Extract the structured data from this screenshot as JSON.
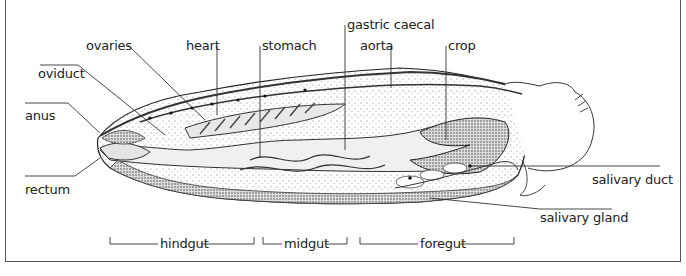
{
  "diagram": {
    "labels": {
      "ovaries": "ovaries",
      "oviduct": "oviduct",
      "anus": "anus",
      "rectum": "rectum",
      "heart": "heart",
      "stomach": "stomach",
      "gastric_caecal": "gastric caecal",
      "aorta": "aorta",
      "crop": "crop",
      "salivary_duct": "salivary duct",
      "salivary_gland": "salivary gland"
    },
    "regions": [
      {
        "label": "hindgut"
      },
      {
        "label": "midgut"
      },
      {
        "label": "foregut"
      }
    ]
  }
}
